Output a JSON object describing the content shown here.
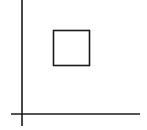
{
  "diagram": {
    "background": "#ffffff",
    "stroke_color": "#1a1a1a",
    "vertical_axis": {
      "x": 22,
      "y1": 0,
      "y2": 126,
      "stroke_width": 1.6
    },
    "horizontal_axis": {
      "y": 114,
      "x1": 11,
      "x2": 140,
      "stroke_width": 1.6
    },
    "square": {
      "x": 53.5,
      "y": 30.5,
      "width": 36,
      "height": 35,
      "stroke_width": 1.6
    }
  }
}
